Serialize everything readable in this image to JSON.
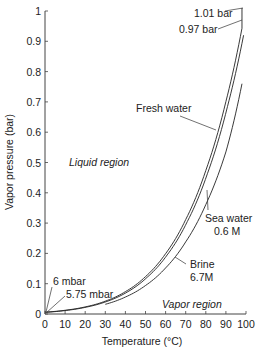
{
  "chart_data": {
    "type": "line",
    "title": "",
    "xlabel": "Temperature (°C)",
    "ylabel": "Vapor pressure (bar)",
    "xlim": [
      0,
      100
    ],
    "ylim": [
      0,
      1
    ],
    "x_ticks": [
      "0",
      "10",
      "20",
      "30",
      "40",
      "50",
      "60",
      "70",
      "80",
      "90",
      "100"
    ],
    "y_ticks": [
      "0",
      "0.1",
      "0.2",
      "0.3",
      "0.4",
      "0.5",
      "0.6",
      "0.7",
      "0.8",
      "0.9",
      "1"
    ],
    "grid": false,
    "series": [
      {
        "name": "Fresh water",
        "x": [
          0,
          10,
          20,
          30,
          40,
          50,
          60,
          70,
          80,
          90,
          98
        ],
        "values": [
          0.006,
          0.0123,
          0.0234,
          0.0424,
          0.0738,
          0.1234,
          0.1992,
          0.3117,
          0.4736,
          0.7011,
          0.943
        ]
      },
      {
        "name": "Sea water 0.6 M",
        "x": [
          0,
          10,
          20,
          30,
          40,
          50,
          60,
          70,
          80,
          90,
          98
        ],
        "values": [
          0.00575,
          0.012,
          0.023,
          0.0415,
          0.072,
          0.121,
          0.195,
          0.305,
          0.463,
          0.685,
          0.92
        ]
      },
      {
        "name": "Brine 6.7M",
        "x": [
          30,
          40,
          50,
          60,
          70,
          80,
          90,
          98
        ],
        "values": [
          0.032,
          0.056,
          0.094,
          0.152,
          0.238,
          0.361,
          0.535,
          0.76
        ]
      }
    ],
    "annotations": [
      {
        "text": "1.01 bar",
        "x": 98,
        "y": 1.01
      },
      {
        "text": "0.97 bar",
        "x": 98,
        "y": 0.97
      },
      {
        "text": "6 mbar",
        "x": 0,
        "y": 0.006
      },
      {
        "text": "5.75 mbar",
        "x": 0,
        "y": 0.00575
      },
      {
        "text": "Liquid region",
        "x": 12,
        "y": 0.5
      },
      {
        "text": "Vapor region",
        "x": 70,
        "y": 0.03
      }
    ],
    "labels": {
      "fresh": "Fresh water",
      "sea1": "Sea water",
      "sea2": "0.6 M",
      "brine1": "Brine",
      "brine2": "6.7M",
      "bar101": "1.01 bar",
      "bar097": "0.97 bar",
      "mbar6": "6 mbar",
      "mbar575": "5.75 mbar",
      "liquid": "Liquid region",
      "vapor": "Vapor region"
    }
  }
}
